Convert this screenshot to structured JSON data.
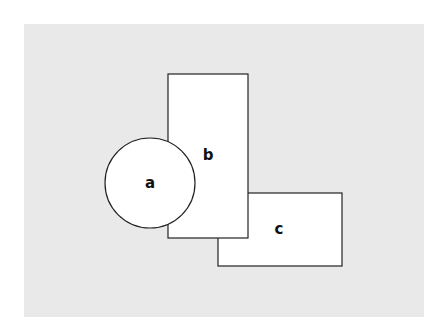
{
  "diagram": {
    "background_color": "#e9e9e9",
    "shapes": [
      {
        "id": "c",
        "type": "rect",
        "label": "c"
      },
      {
        "id": "b",
        "type": "rect",
        "label": "b"
      },
      {
        "id": "a",
        "type": "circle",
        "label": "a"
      }
    ],
    "labels": {
      "a": "a",
      "b": "b",
      "c": "c"
    }
  }
}
